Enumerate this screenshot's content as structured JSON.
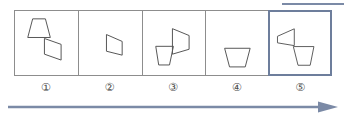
{
  "diagram": {
    "colors": {
      "cell_border": "#8d8d8d",
      "selected_border": "#6d7e9c",
      "shape_stroke": "#555555",
      "arrow": "#7b8aa6",
      "label_text": "#4a4a4a",
      "background": "#ffffff"
    },
    "top_rule": {
      "name": "top-rule",
      "color": "#7b8aa6"
    },
    "arrow": {
      "name": "progression-arrow",
      "direction": "right",
      "color": "#7b8aa6",
      "label": ""
    },
    "selected_index": 5,
    "cells": [
      {
        "index": 1,
        "label": "①",
        "selected": false,
        "description": "upright trapezoid upper-left joined at a point to a right-pointing trapezoid lower-right",
        "shapes": [
          {
            "name": "trapezoid-upright",
            "points": "18,8 31,8 36,27 13,27"
          },
          {
            "name": "trapezoid-pointing-right",
            "points": "30,28 47,34 47,50 30,44"
          }
        ]
      },
      {
        "index": 2,
        "label": "②",
        "selected": false,
        "description": "single right-pointing trapezoid, slightly right of center",
        "shapes": [
          {
            "name": "trapezoid-pointing-right",
            "points": "28,24 44,31 44,45 28,41"
          }
        ]
      },
      {
        "index": 3,
        "label": "③",
        "selected": false,
        "description": "right-pointing trapezoid upper-right joined at a point to a downward-narrowing trapezoid lower-left",
        "shapes": [
          {
            "name": "trapezoid-pointing-right",
            "points": "30,18 47,25 47,39 30,44"
          },
          {
            "name": "trapezoid-downward-narrowing",
            "points": "13,36 31,36 27,55 16,55"
          }
        ]
      },
      {
        "index": 4,
        "label": "④",
        "selected": false,
        "description": "single downward-narrowing trapezoid, centered low",
        "shapes": [
          {
            "name": "trapezoid-downward-narrowing",
            "points": "19,38 45,38 40,57 24,57"
          }
        ]
      },
      {
        "index": 5,
        "label": "⑤",
        "selected": true,
        "description": "left-pointing trapezoid upper-left joined at a point to a downward-narrowing trapezoid lower-right",
        "shapes": [
          {
            "name": "trapezoid-pointing-left",
            "points": "8,26 26,18 26,36 8,33"
          },
          {
            "name": "trapezoid-downward-narrowing",
            "points": "25,37 47,37 43,57 30,57"
          }
        ]
      }
    ]
  }
}
